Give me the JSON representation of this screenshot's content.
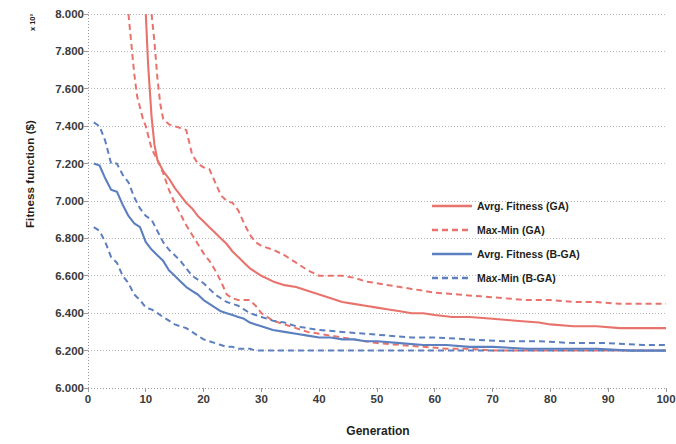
{
  "chart_data": {
    "type": "line",
    "title": "",
    "xlabel": "Generation",
    "ylabel": "Fitness function ($)",
    "exponent_label": "x 10³",
    "xlim": [
      0,
      100
    ],
    "ylim": [
      6.0,
      8.0
    ],
    "xticks": [
      0,
      10,
      20,
      30,
      40,
      50,
      60,
      70,
      80,
      90,
      100
    ],
    "xtick_labels": [
      "0",
      "10",
      "20",
      "30",
      "40",
      "50",
      "60",
      "70",
      "80",
      "90",
      "100"
    ],
    "yticks": [
      6.0,
      6.2,
      6.4,
      6.6,
      6.8,
      7.0,
      7.2,
      7.4,
      7.6,
      7.8,
      8.0
    ],
    "ytick_labels": [
      "6.000",
      "6.200",
      "6.400",
      "6.600",
      "6.800",
      "7.000",
      "7.200",
      "7.400",
      "7.600",
      "7.800",
      "8.000"
    ],
    "grid": "horizontal-dotted",
    "legend_position": "center-right",
    "colors": {
      "ga": "#E8736C",
      "bga": "#5C7FC0",
      "grid": "#b9b9bd",
      "axis": "#9a9a9e",
      "text": "#231f20"
    },
    "series": [
      {
        "name": "Avrg. Fitness (GA)",
        "key": "avg_ga",
        "color": "#E8736C",
        "style": "solid",
        "x": [
          10,
          10.4,
          11,
          11.5,
          12,
          13,
          14,
          15,
          16,
          17,
          18,
          19,
          20,
          21,
          22,
          23,
          24,
          25,
          26,
          27,
          28,
          29,
          30,
          32,
          34,
          36,
          38,
          40,
          42,
          44,
          46,
          48,
          50,
          52,
          54,
          56,
          58,
          60,
          63,
          66,
          70,
          74,
          78,
          80,
          84,
          88,
          92,
          96,
          100
        ],
        "y": [
          8.0,
          7.73,
          7.45,
          7.3,
          7.22,
          7.16,
          7.12,
          7.07,
          7.03,
          6.99,
          6.96,
          6.92,
          6.89,
          6.86,
          6.83,
          6.8,
          6.77,
          6.73,
          6.7,
          6.67,
          6.64,
          6.62,
          6.6,
          6.57,
          6.55,
          6.54,
          6.52,
          6.5,
          6.48,
          6.46,
          6.45,
          6.44,
          6.43,
          6.42,
          6.41,
          6.4,
          6.4,
          6.39,
          6.38,
          6.38,
          6.37,
          6.36,
          6.35,
          6.34,
          6.33,
          6.33,
          6.32,
          6.32,
          6.32
        ]
      },
      {
        "name": "Max-Min (GA) — upper",
        "key": "max_ga",
        "color": "#E8736C",
        "style": "dashed",
        "x": [
          11,
          11.5,
          12,
          12.5,
          13,
          14,
          15,
          16,
          17,
          18,
          19,
          20,
          21,
          22,
          23,
          24,
          25,
          26,
          27,
          28,
          29,
          30,
          32,
          34,
          36,
          38,
          40,
          42,
          44,
          46,
          48,
          50,
          52,
          54,
          56,
          58,
          60,
          64,
          68,
          72,
          76,
          80,
          84,
          88,
          92,
          96,
          100
        ],
        "y": [
          8.0,
          7.85,
          7.66,
          7.52,
          7.44,
          7.41,
          7.4,
          7.39,
          7.38,
          7.25,
          7.2,
          7.18,
          7.17,
          7.1,
          7.03,
          7.0,
          6.99,
          6.95,
          6.88,
          6.82,
          6.78,
          6.76,
          6.74,
          6.71,
          6.67,
          6.63,
          6.6,
          6.6,
          6.6,
          6.59,
          6.57,
          6.56,
          6.55,
          6.54,
          6.53,
          6.52,
          6.51,
          6.5,
          6.49,
          6.48,
          6.47,
          6.47,
          6.46,
          6.46,
          6.45,
          6.45,
          6.45
        ]
      },
      {
        "name": "Max-Min (GA) — lower",
        "key": "min_ga",
        "color": "#E8736C",
        "style": "dashed",
        "x": [
          7,
          7.5,
          8,
          8.5,
          9,
          9.5,
          10,
          11,
          12,
          13,
          14,
          15,
          16,
          17,
          18,
          19,
          20,
          21,
          22,
          23,
          24,
          25,
          26,
          27,
          28,
          29,
          30,
          31,
          32,
          33,
          34,
          35,
          36,
          38,
          40,
          42,
          44,
          46,
          48,
          50,
          54,
          58,
          62,
          66,
          70,
          76,
          82,
          88,
          94,
          100
        ],
        "y": [
          8.0,
          7.84,
          7.68,
          7.56,
          7.5,
          7.44,
          7.4,
          7.28,
          7.22,
          7.15,
          7.06,
          6.99,
          6.93,
          6.87,
          6.82,
          6.77,
          6.72,
          6.68,
          6.63,
          6.57,
          6.5,
          6.48,
          6.47,
          6.47,
          6.47,
          6.44,
          6.4,
          6.38,
          6.36,
          6.35,
          6.34,
          6.33,
          6.32,
          6.3,
          6.29,
          6.28,
          6.27,
          6.26,
          6.25,
          6.24,
          6.23,
          6.22,
          6.21,
          6.21,
          6.2,
          6.2,
          6.2,
          6.2,
          6.2,
          6.2
        ]
      },
      {
        "name": "Avrg. Fitness (B-GA)",
        "key": "avg_bga",
        "color": "#5C7FC0",
        "style": "solid",
        "x": [
          1,
          2,
          3,
          4,
          5,
          6,
          7,
          8,
          9,
          10,
          11,
          12,
          13,
          14,
          15,
          16,
          17,
          18,
          19,
          20,
          21,
          22,
          23,
          24,
          25,
          26,
          27,
          28,
          29,
          30,
          32,
          34,
          36,
          38,
          40,
          42,
          44,
          46,
          48,
          50,
          54,
          58,
          62,
          66,
          70,
          76,
          82,
          88,
          94,
          100
        ],
        "y": [
          7.2,
          7.19,
          7.12,
          7.06,
          7.05,
          6.98,
          6.92,
          6.88,
          6.86,
          6.78,
          6.74,
          6.71,
          6.68,
          6.63,
          6.6,
          6.57,
          6.54,
          6.52,
          6.5,
          6.47,
          6.45,
          6.43,
          6.41,
          6.4,
          6.39,
          6.38,
          6.37,
          6.35,
          6.34,
          6.33,
          6.31,
          6.3,
          6.29,
          6.28,
          6.27,
          6.27,
          6.26,
          6.26,
          6.25,
          6.25,
          6.24,
          6.23,
          6.23,
          6.22,
          6.22,
          6.21,
          6.21,
          6.21,
          6.2,
          6.2
        ]
      },
      {
        "name": "Max-Min (B-GA) — upper",
        "key": "max_bga",
        "color": "#5C7FC0",
        "style": "dashed",
        "x": [
          1,
          2,
          3,
          4,
          5,
          6,
          7,
          8,
          9,
          10,
          11,
          12,
          13,
          14,
          15,
          16,
          17,
          18,
          19,
          20,
          21,
          22,
          23,
          24,
          25,
          26,
          27,
          28,
          29,
          30,
          32,
          34,
          36,
          38,
          40,
          44,
          48,
          52,
          56,
          60,
          66,
          72,
          78,
          84,
          90,
          96,
          100
        ],
        "y": [
          7.42,
          7.4,
          7.32,
          7.2,
          7.2,
          7.14,
          7.1,
          7.02,
          6.96,
          6.92,
          6.9,
          6.84,
          6.78,
          6.74,
          6.71,
          6.68,
          6.64,
          6.6,
          6.58,
          6.56,
          6.53,
          6.5,
          6.48,
          6.46,
          6.45,
          6.44,
          6.42,
          6.4,
          6.39,
          6.38,
          6.36,
          6.35,
          6.33,
          6.32,
          6.31,
          6.3,
          6.29,
          6.28,
          6.27,
          6.27,
          6.26,
          6.25,
          6.25,
          6.24,
          6.24,
          6.23,
          6.23
        ]
      },
      {
        "name": "Max-Min (B-GA) — lower",
        "key": "min_bga",
        "color": "#5C7FC0",
        "style": "dashed",
        "x": [
          1,
          2,
          3,
          4,
          5,
          6,
          7,
          8,
          9,
          10,
          11,
          12,
          13,
          14,
          15,
          16,
          17,
          18,
          19,
          20,
          21,
          22,
          23,
          24,
          25,
          26,
          27,
          28,
          29,
          30,
          34,
          38,
          42,
          46,
          50,
          56,
          62,
          68,
          74,
          80,
          86,
          92,
          100
        ],
        "y": [
          6.86,
          6.84,
          6.78,
          6.7,
          6.67,
          6.6,
          6.56,
          6.5,
          6.47,
          6.43,
          6.42,
          6.4,
          6.38,
          6.36,
          6.34,
          6.33,
          6.32,
          6.3,
          6.28,
          6.26,
          6.25,
          6.24,
          6.23,
          6.22,
          6.22,
          6.21,
          6.21,
          6.21,
          6.2,
          6.2,
          6.2,
          6.2,
          6.2,
          6.2,
          6.2,
          6.2,
          6.2,
          6.2,
          6.2,
          6.2,
          6.2,
          6.2,
          6.2
        ]
      }
    ],
    "legend": [
      {
        "label": "Avrg. Fitness (GA)",
        "color": "#E8736C",
        "style": "solid"
      },
      {
        "label": "Max-Min (GA)",
        "color": "#E8736C",
        "style": "dashed"
      },
      {
        "label": "Avrg. Fitness (B-GA)",
        "color": "#5C7FC0",
        "style": "solid"
      },
      {
        "label": "Max-Min (B-GA)",
        "color": "#5C7FC0",
        "style": "dashed"
      }
    ]
  }
}
